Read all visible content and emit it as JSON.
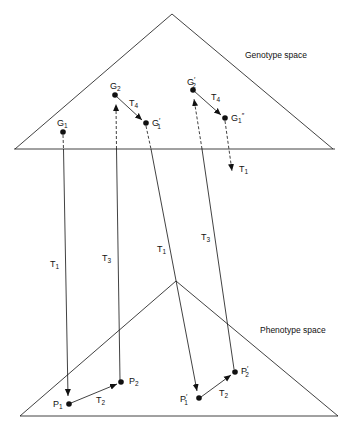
{
  "spaces": {
    "genotype": {
      "label": "Genotype space"
    },
    "phenotype": {
      "label": "Phenotype space"
    }
  },
  "points": {
    "G1": {
      "base": "G",
      "sub": "1",
      "prime": ""
    },
    "G2": {
      "base": "G",
      "sub": "2",
      "prime": ""
    },
    "G1p": {
      "base": "G",
      "sub": "1",
      "prime": "′"
    },
    "G2p": {
      "base": "G",
      "sub": "2",
      "prime": "′"
    },
    "G1pp": {
      "base": "G",
      "sub": "1",
      "prime": "″"
    },
    "P1": {
      "base": "P",
      "sub": "1",
      "prime": ""
    },
    "P2": {
      "base": "P",
      "sub": "2",
      "prime": ""
    },
    "P1p": {
      "base": "P",
      "sub": "1",
      "prime": "′"
    },
    "P2p": {
      "base": "P",
      "sub": "2",
      "prime": "′"
    }
  },
  "transforms": {
    "T1": {
      "base": "T",
      "sub": "1"
    },
    "T2": {
      "base": "T",
      "sub": "2"
    },
    "T3": {
      "base": "T",
      "sub": "3"
    },
    "T4": {
      "base": "T",
      "sub": "4"
    }
  }
}
